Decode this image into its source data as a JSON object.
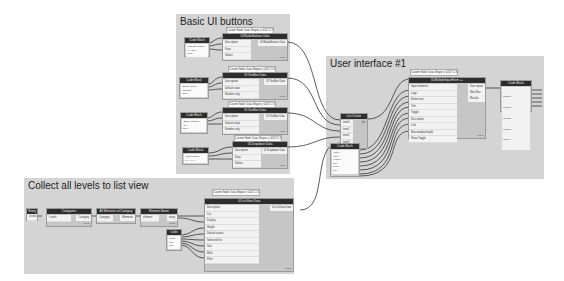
{
  "groups": {
    "basic_ui": {
      "title": "Basic UI buttons"
    },
    "user_interface": {
      "title": "User interface #1"
    },
    "collect_levels": {
      "title": "Collect all levels to list view"
    }
  },
  "notes": {
    "n1": "Custom Node: Data-Shapes | v2017.2.3",
    "n2": "Custom Node: Data-Shapes | v2017.2.3",
    "n3": "Custom Node: Data-Shapes | v2017.2.3",
    "n4": "Custom Node: Data-Shapes | v2017.2.3",
    "n5": "Custom Node: Data-Shapes | v2017.2.3",
    "n6": "Custom Node: Data-Shapes | v2017.2.3"
  },
  "nodes": {
    "radio": {
      "title": "UI.RadioButtons Data",
      "inputs": [
        "Description",
        "Keys",
        "Values"
      ],
      "outputs": [
        "UI.RadioButtons Data"
      ],
      "foot": "AUTO"
    },
    "textbox": {
      "title": "UI.TextBox Data",
      "inputs": [
        "Description",
        "Default value",
        "Number only"
      ],
      "outputs": [
        "UI.TextBox Data"
      ],
      "foot": "AUTO"
    },
    "checkbox": {
      "title": "UI.TextBox Data",
      "inputs": [
        "Description",
        "Default value",
        "Number only"
      ],
      "outputs": [
        "UI.TextBox Data"
      ],
      "foot": "AUTO"
    },
    "dropdown": {
      "title": "UI.Dropdown Data",
      "inputs": [
        "Description",
        "Keys",
        "Values"
      ],
      "outputs": [
        "UI.Dropdown Data"
      ],
      "foot": "AUTO"
    },
    "list_create": {
      "title": "List.Create",
      "inputs": [
        "item0",
        "item1",
        "item2",
        "item3",
        "item4"
      ],
      "outputs": [
        "list"
      ]
    },
    "multiple_inputs": {
      "title": "UI.MultipleInputForm ++",
      "inputs": [
        "Input elements",
        "Logo",
        "Button text",
        "Title",
        "Toggle",
        "Description",
        "Link",
        "Max window height",
        "Show Toggle"
      ],
      "outputs": [
        "User inputs",
        "Was Run",
        "Results"
      ],
      "foot": "AUTO"
    },
    "code_out": {
      "title": "Code Block",
      "outputs": [
        "item[0];",
        "item[1];",
        "item[2];",
        "item[3];",
        "item[4];"
      ]
    },
    "listview": {
      "title": "UI.ListView Data",
      "inputs": [
        "Description",
        "List",
        "Display",
        "Height",
        "Default values",
        "Selected first",
        "Sort",
        "Multi",
        "Filter"
      ],
      "outputs": [
        "UI.ListView Data"
      ],
      "foot": "AUTO"
    },
    "string": {
      "title": "String",
      "value": "Levels"
    },
    "categories": {
      "title": "Categories",
      "value": "Levels",
      "outputs": [
        "Category"
      ],
      "foot": "AUTO"
    },
    "all_elements": {
      "title": "All Elements of Category",
      "inputs": [
        "Category"
      ],
      "outputs": [
        "Elements"
      ]
    },
    "element_name": {
      "title": "Element.Name",
      "inputs": [
        "element"
      ],
      "outputs": [
        "string"
      ],
      "foot": "AUTO"
    }
  },
  "codeblocks": {
    "cb1": {
      "title": "Code Block",
      "text": "\"Choose option\";\n{\"A\",\"B\"};\n{1,2};"
    },
    "cb2": {
      "title": "Code Block",
      "text": "\"Enter value\";\n\"Default\";\nfalse;"
    },
    "cb3": {
      "title": "Code Block",
      "text": "\"Enter number\";\n\"0\";\ntrue;"
    },
    "cb4": {
      "title": "Code Block",
      "text": "\"Select item\";\n{\"X\",\"Y\"};"
    },
    "cb5": {
      "title": "Code Block",
      "text": "\"Title\";\n\"OK\";\n\"Form\";\ntrue;\n\"Info\";\nnull;"
    },
    "cb6": {
      "title": "Code Block",
      "text": "\"Pick\";\n300;\ntrue;"
    }
  }
}
